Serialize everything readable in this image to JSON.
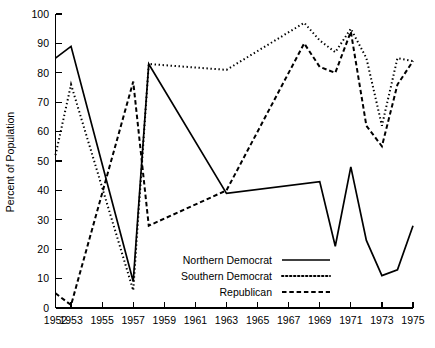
{
  "chart_data": {
    "type": "line",
    "title": "",
    "xlabel": "",
    "ylabel": "Percent of Population",
    "xlim": [
      1952,
      1975
    ],
    "ylim": [
      0,
      100
    ],
    "grid": false,
    "legend_position": "inside-lower-center",
    "x_tick_labels": [
      "1952",
      "1953",
      "1955",
      "1957",
      "1959",
      "1961",
      "1963",
      "1965",
      "1967",
      "1969",
      "1971",
      "1973",
      "1975"
    ],
    "x_tick_values": [
      1952,
      1953,
      1955,
      1957,
      1959,
      1961,
      1963,
      1965,
      1967,
      1969,
      1971,
      1973,
      1975
    ],
    "y_tick_labels": [
      "0",
      "10",
      "20",
      "30",
      "40",
      "50",
      "60",
      "70",
      "80",
      "90",
      "100"
    ],
    "y_tick_values": [
      0,
      10,
      20,
      30,
      40,
      50,
      60,
      70,
      80,
      90,
      100
    ],
    "series": [
      {
        "name": "Northern Democrat",
        "style": "solid",
        "color": "#000000",
        "x": [
          1952,
          1953,
          1957,
          1958,
          1963,
          1969,
          1970,
          1971,
          1972,
          1973,
          1974,
          1975
        ],
        "values": [
          85,
          89,
          9,
          83,
          39,
          43,
          21,
          48,
          23,
          11,
          13,
          28
        ]
      },
      {
        "name": "Southern Democrat",
        "style": "dotted",
        "color": "#000000",
        "x": [
          1952,
          1953,
          1957,
          1958,
          1963,
          1968,
          1969,
          1970,
          1971,
          1972,
          1973,
          1974,
          1975
        ],
        "values": [
          52,
          76,
          6,
          83,
          81,
          97,
          91,
          87,
          95,
          85,
          62,
          85,
          84
        ]
      },
      {
        "name": "Republican",
        "style": "dashed",
        "color": "#000000",
        "x": [
          1952,
          1953,
          1957,
          1958,
          1963,
          1968,
          1969,
          1970,
          1971,
          1972,
          1973,
          1974,
          1975
        ],
        "values": [
          5,
          1,
          77,
          28,
          40,
          90,
          82,
          80,
          94,
          62,
          55,
          76,
          84
        ]
      }
    ]
  },
  "axis": {
    "y_title": "Percent of Population"
  },
  "legend": {
    "items": [
      {
        "label": "Northern Democrat",
        "style": "solid"
      },
      {
        "label": "Southern Democrat",
        "style": "dotted"
      },
      {
        "label": "Republican",
        "style": "dashed"
      }
    ]
  }
}
